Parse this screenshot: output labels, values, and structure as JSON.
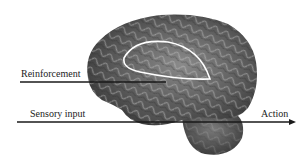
{
  "figure": {
    "labels": {
      "reinforcement": "Reinforcement",
      "sensory_input": "Sensory input",
      "action": "Action"
    },
    "colors": {
      "background": "#ffffff",
      "brain_dark": "#3a3a3a",
      "brain_mid": "#6e6e6e",
      "brain_light": "#a8a8a8",
      "loop": "#ffffff",
      "lines": "#1a1a1a"
    }
  }
}
